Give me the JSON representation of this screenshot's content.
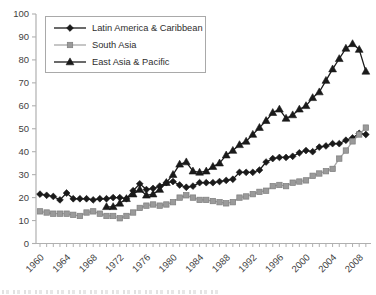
{
  "figure": {
    "background": "#ffffff"
  },
  "chart_data": {
    "type": "line",
    "title": "",
    "xlabel": "",
    "ylabel": "",
    "grid": false,
    "legend_position": "top-left",
    "ylim": [
      0,
      100
    ],
    "yticks": [
      0,
      10,
      20,
      30,
      40,
      50,
      60,
      70,
      80,
      90,
      100
    ],
    "x_years": [
      1960,
      1961,
      1962,
      1963,
      1964,
      1965,
      1966,
      1967,
      1968,
      1969,
      1970,
      1971,
      1972,
      1973,
      1974,
      1975,
      1976,
      1977,
      1978,
      1979,
      1980,
      1981,
      1982,
      1983,
      1984,
      1985,
      1986,
      1987,
      1988,
      1989,
      1990,
      1991,
      1992,
      1993,
      1994,
      1995,
      1996,
      1997,
      1998,
      1999,
      2000,
      2001,
      2002,
      2003,
      2004,
      2005,
      2006,
      2007,
      2008,
      2009
    ],
    "x_labeled_ticks": [
      1960,
      1964,
      1968,
      1972,
      1976,
      1980,
      1984,
      1988,
      1992,
      1996,
      2000,
      2004,
      2008
    ],
    "axis_color": "#b0b0b0",
    "tick_label_color": "#3f3f3f",
    "series": [
      {
        "name": "Latin America & Caribbean",
        "marker": "diamond",
        "color": "#1a1a1a",
        "line_color": "#1a1a1a",
        "edge_color": "#1a1a1a",
        "values": [
          21.5,
          21,
          20.5,
          19,
          22,
          19.5,
          19.5,
          19.5,
          19,
          19.5,
          19.5,
          20,
          20,
          19.5,
          23,
          26,
          23.5,
          24,
          25,
          26.5,
          27,
          25.5,
          24.5,
          25,
          26.5,
          26.5,
          26.5,
          27,
          27.5,
          28,
          31,
          31,
          31,
          32,
          35.5,
          37,
          37.5,
          37.5,
          38,
          39.5,
          40.5,
          40,
          42,
          42.5,
          43.5,
          43.5,
          45,
          46,
          48,
          47.5
        ]
      },
      {
        "name": "South Asia",
        "marker": "square",
        "color": "#9a9a9a",
        "line_color": "#a8a8a8",
        "edge_color": "#7d7d7d",
        "values": [
          14,
          13.5,
          13,
          13,
          13,
          12.5,
          12,
          13.5,
          14,
          13,
          12,
          12,
          11,
          12,
          13.5,
          15.5,
          16.5,
          17,
          16.5,
          17,
          18,
          20,
          21,
          20,
          19,
          19,
          18.5,
          18,
          17.5,
          18,
          20,
          20.5,
          21.5,
          22.5,
          23,
          25,
          25.5,
          25,
          26.5,
          27,
          27.5,
          29.5,
          30.5,
          31.5,
          32.5,
          37,
          40.5,
          44.5,
          47.5,
          50.5
        ]
      },
      {
        "name": "East Asia & Pacific",
        "marker": "triangle",
        "color": "#1a1a1a",
        "line_color": "#1a1a1a",
        "edge_color": "#1a1a1a",
        "values": [
          null,
          null,
          null,
          null,
          null,
          null,
          null,
          null,
          null,
          null,
          16,
          16,
          17.5,
          19.5,
          21.5,
          23.5,
          21,
          21.5,
          23.5,
          26.5,
          30,
          34.5,
          35.5,
          31.5,
          31,
          31.5,
          33.5,
          35,
          38.5,
          40.5,
          43,
          44.5,
          47.5,
          50.5,
          53.5,
          57,
          58.5,
          54.5,
          56,
          58.5,
          60,
          63.5,
          66,
          71,
          76,
          80.5,
          85,
          87,
          84.5,
          75
        ]
      }
    ]
  }
}
